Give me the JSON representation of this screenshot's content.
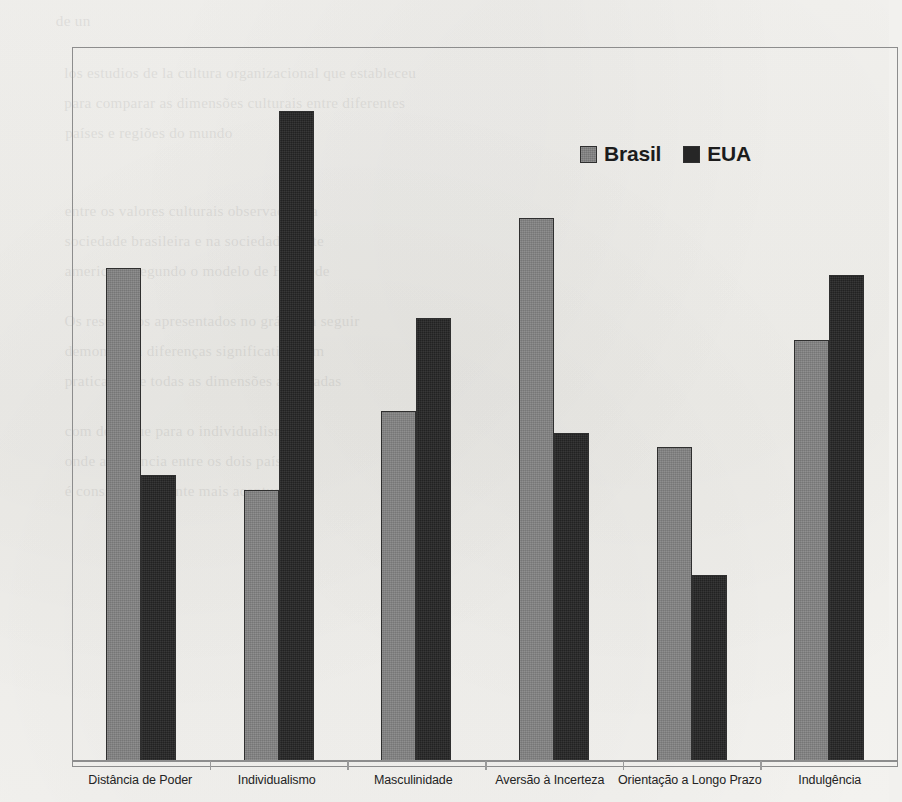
{
  "chart_data": {
    "type": "bar",
    "title": "",
    "subtitle": "",
    "xlabel": "",
    "ylabel": "",
    "grid": false,
    "ylim": [
      0,
      100
    ],
    "axis_tick_labels_visible": false,
    "legend_position": "top-right-inside",
    "categories": [
      "Distância de Poder",
      "Individualismo",
      "Masculinidade",
      "Aversão à Incerteza",
      "Orientação a Longo Prazo",
      "Indulgência"
    ],
    "series": [
      {
        "name": "Brasil",
        "color": "#828282",
        "values": [
          69,
          38,
          49,
          76,
          44,
          59
        ]
      },
      {
        "name": "EUA",
        "color": "#262626",
        "values": [
          40,
          91,
          62,
          46,
          26,
          68
        ]
      }
    ]
  },
  "legend": {
    "entries": [
      {
        "label": "Brasil",
        "swatch": "legend-swatch-brasil"
      },
      {
        "label": "EUA",
        "swatch": "legend-swatch-eua"
      }
    ]
  },
  "page_background": {
    "ghost_text": [
      "de un",
      "los estudios de la cultura organizacional que estableceu",
      "para comparar as dimensões culturais entre diferentes",
      "países e regiões do mundo",
      "entre os valores culturais observados na",
      "sociedade brasileira e na sociedade norte",
      "americana segundo o modelo de Hofstede",
      "Os resultados apresentados no gráfico a seguir",
      "demonstram diferenças significativas em",
      "praticamente todas as dimensões analisadas",
      "com destaque para o individualismo",
      "onde a distância entre os dois países",
      "é consideravelmente mais acentuada"
    ]
  },
  "colors": {
    "brasil": "#828282",
    "eua": "#262626",
    "frame": "#8d8d8d",
    "paper": "#f2f1ee",
    "text": "#232323"
  }
}
